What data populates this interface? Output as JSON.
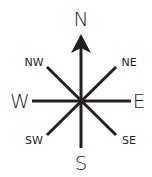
{
  "diagram": {
    "type": "compass-rose",
    "colors": {
      "stroke": "#231f20",
      "background": "#ffffff"
    },
    "center": {
      "x": 81,
      "y": 101
    },
    "labels": {
      "north": "N",
      "south": "S",
      "east": "E",
      "west": "W",
      "northeast": "NE",
      "northwest": "NW",
      "southeast": "SE",
      "southwest": "SW"
    },
    "pointer": "north-arrow"
  }
}
